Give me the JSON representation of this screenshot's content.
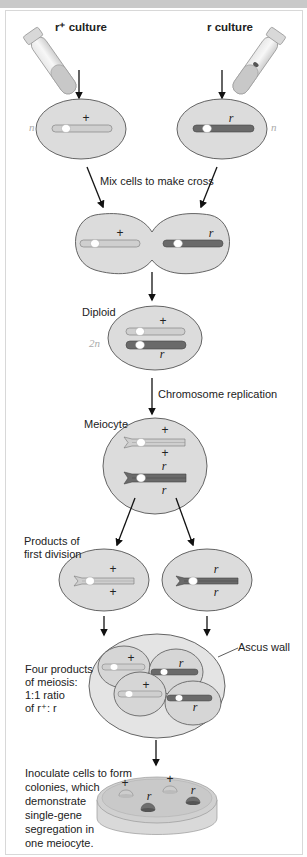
{
  "title_bar": "",
  "labels": {
    "r_plus_culture": "r⁺ culture",
    "r_culture": "r culture",
    "ploidy_n_left": "n",
    "ploidy_n_right": "n",
    "mix_cells": "Mix cells to make cross",
    "diploid": "Diploid",
    "ploidy_2n": "2n",
    "chromosome_replication": "Chromosome replication",
    "meiocyte": "Meiocyte",
    "products_first_division_1": "Products of",
    "products_first_division_2": "first division",
    "ascus_wall": "Ascus wall",
    "four_products": [
      "Four products",
      "of meiosis:",
      "1:1 ratio",
      "of r⁺: r"
    ],
    "inoculate": [
      "Inoculate cells to form",
      "colonies, which",
      "demonstrate",
      "single-gene",
      "segregation in",
      "one meiocyte."
    ]
  },
  "alleles": {
    "plus": "+",
    "r": "r"
  },
  "colors": {
    "cell_fill": "#dcdcdc",
    "cell_stroke": "#555555",
    "chrom_light": "#cfcfcf",
    "chrom_dark": "#6a6a6a",
    "centromere": "#ffffff",
    "arrow": "#111111",
    "ploidy_text": "#aaaaaa"
  }
}
